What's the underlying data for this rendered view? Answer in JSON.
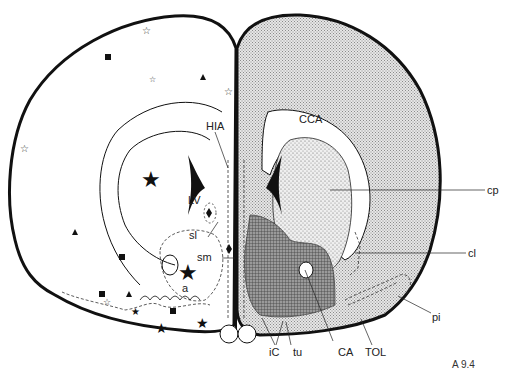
{
  "figure": {
    "plate_id": "A 9.4"
  },
  "labels": {
    "HIA": "HIA",
    "CCA": "CCA",
    "LV": "LV",
    "sl": "sl",
    "sm": "sm",
    "a": "a",
    "cp": "cp",
    "cl": "cl",
    "pi": "pi",
    "iC": "iC",
    "tu": "tu",
    "CA": "CA",
    "TOL": "TOL"
  },
  "colors": {
    "outline": "#111111",
    "light_stipple": "#d6d6d6",
    "medium_dots": "#c8c8c8",
    "dark_hatch": "#7a7a7a",
    "background": "#ffffff"
  },
  "markers": {
    "legend_types": [
      "open-star",
      "filled-star",
      "filled-square",
      "filled-triangle",
      "filled-diamond"
    ]
  }
}
